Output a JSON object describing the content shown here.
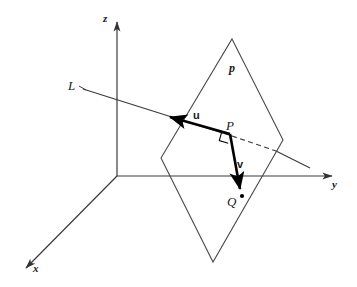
{
  "figure": {
    "type": "geometric-diagram",
    "background_color": "#ffffff",
    "stroke_color": "#333333",
    "bold_stroke_color": "#000000",
    "width": 357,
    "height": 287
  },
  "axes": [
    {
      "id": "z",
      "label": "z",
      "label_x": 103,
      "label_y": 15,
      "from": [
        117,
        176
      ],
      "to": [
        117,
        20
      ],
      "arrow": true
    },
    {
      "id": "y",
      "label": "y",
      "label_x": 332,
      "label_y": 181,
      "from": [
        117,
        176
      ],
      "to": [
        336,
        176
      ],
      "arrow": true
    },
    {
      "id": "x",
      "label": "x",
      "label_x": 33,
      "label_y": 265,
      "from": [
        117,
        176
      ],
      "to": [
        23,
        270
      ],
      "arrow": true
    }
  ],
  "plane": {
    "label": "p",
    "label_x": 229,
    "label_y": 63,
    "vertices": [
      [
        232,
        39
      ],
      [
        283,
        140
      ],
      [
        213,
        262
      ],
      [
        161,
        158
      ]
    ]
  },
  "line": {
    "label": "L",
    "label_x": 69,
    "label_y": 80,
    "from": [
      83,
      89
    ],
    "to": [
      310,
      168
    ],
    "dashed_segment": {
      "from": [
        232,
        136
      ],
      "to": [
        276,
        151
      ]
    }
  },
  "points": [
    {
      "id": "P",
      "label": "P",
      "x": 230,
      "y": 134,
      "label_x": 226,
      "label_y": 120,
      "dot": false
    },
    {
      "id": "Q",
      "label": "Q",
      "x": 242,
      "y": 196,
      "label_x": 228,
      "label_y": 196,
      "dot": true
    }
  ],
  "vectors": [
    {
      "id": "u",
      "label": "u",
      "from": [
        230,
        134
      ],
      "to": [
        166,
        116
      ],
      "label_x": 194,
      "label_y": 110,
      "bold": true
    },
    {
      "id": "v",
      "label": "v",
      "from": [
        230,
        134
      ],
      "to": [
        240,
        193
      ],
      "label_x": 238,
      "label_y": 160,
      "bold": true
    }
  ],
  "right_angle": {
    "name": "perpendicular-marker",
    "at": [
      230,
      134
    ],
    "size": 9
  }
}
